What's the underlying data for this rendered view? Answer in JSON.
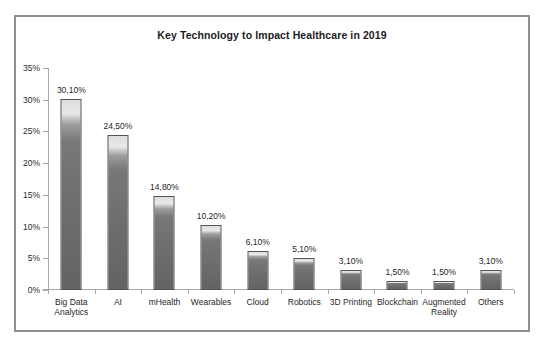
{
  "scan_artifact_text": "",
  "chart_data": {
    "type": "bar",
    "title": "Key Technology to Impact Healthcare  in 2019",
    "xlabel": "",
    "ylabel": "",
    "ylim": [
      0,
      35
    ],
    "ytick_step": 5,
    "ytick_labels": [
      "0%",
      "5%",
      "10%",
      "15%",
      "20%",
      "25%",
      "30%",
      "35%"
    ],
    "ytick_values": [
      0,
      5,
      10,
      15,
      20,
      25,
      30,
      35
    ],
    "grid": false,
    "legend": false,
    "decimal_separator": ",",
    "categories": [
      "Big Data\nAnalytics",
      "AI",
      "mHealth",
      "Wearables",
      "Cloud",
      "Robotics",
      "3D Printing",
      "Blockchain",
      "Augmented\nReality",
      "Others"
    ],
    "values": [
      30.1,
      24.5,
      14.8,
      10.2,
      6.1,
      5.1,
      3.1,
      1.5,
      1.5,
      3.1
    ],
    "value_labels": [
      "30,10%",
      "24,50%",
      "14,80%",
      "10,20%",
      "6,10%",
      "5,10%",
      "3,10%",
      "1,50%",
      "1,50%",
      "3,10%"
    ],
    "colors": {
      "bar_fill": "#6e6e6e",
      "bar_highlight": "#e8e8e8",
      "bar_border": "#555555",
      "axis": "#a8a8a8",
      "frame": "#8f8f8f",
      "text": "#1f1f1f",
      "background": "#ffffff"
    }
  }
}
